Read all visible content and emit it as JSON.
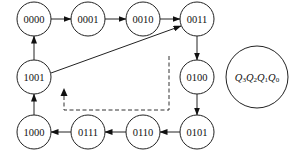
{
  "diagram": {
    "type": "state-transition",
    "states": [
      {
        "id": "s0",
        "label": "0000",
        "x": 34,
        "y": 19
      },
      {
        "id": "s1",
        "label": "0001",
        "x": 88,
        "y": 19
      },
      {
        "id": "s2",
        "label": "0010",
        "x": 143,
        "y": 19
      },
      {
        "id": "s3",
        "label": "0011",
        "x": 197,
        "y": 19
      },
      {
        "id": "s4",
        "label": "0100",
        "x": 197,
        "y": 77
      },
      {
        "id": "s5",
        "label": "0101",
        "x": 197,
        "y": 132
      },
      {
        "id": "s6",
        "label": "0110",
        "x": 143,
        "y": 132
      },
      {
        "id": "s7",
        "label": "0111",
        "x": 88,
        "y": 132
      },
      {
        "id": "s8",
        "label": "1000",
        "x": 34,
        "y": 132
      },
      {
        "id": "s9",
        "label": "1001",
        "x": 34,
        "y": 77
      }
    ],
    "transitions": [
      {
        "from": "0000",
        "to": "0001"
      },
      {
        "from": "0001",
        "to": "0010"
      },
      {
        "from": "0010",
        "to": "0011"
      },
      {
        "from": "0011",
        "to": "0100"
      },
      {
        "from": "0100",
        "to": "0101"
      },
      {
        "from": "0101",
        "to": "0110"
      },
      {
        "from": "0110",
        "to": "0111"
      },
      {
        "from": "0111",
        "to": "1000"
      },
      {
        "from": "1000",
        "to": "1001"
      },
      {
        "from": "1001",
        "to": "0000"
      },
      {
        "from": "1001",
        "to": "0011"
      }
    ],
    "dashed_path": {
      "style": "dashed",
      "direction": "from 0100 region back toward 1001 region"
    },
    "legend": {
      "label": "Q3Q2Q1Q0",
      "parts": [
        {
          "base": "Q",
          "sub": "3"
        },
        {
          "base": "Q",
          "sub": "2"
        },
        {
          "base": "Q",
          "sub": "1"
        },
        {
          "base": "Q",
          "sub": "0"
        }
      ]
    }
  }
}
